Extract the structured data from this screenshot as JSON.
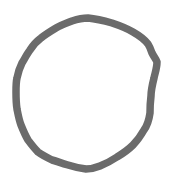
{
  "canvas": {
    "width": 175,
    "height": 187,
    "background_color": "#ffffff",
    "description": "hand-drawn closed circular outline"
  },
  "shape": {
    "name": "hand-drawn-circle",
    "kind": "closed-polyline",
    "stroke_color": "#6b6b6b",
    "stroke_width": 7.5,
    "fill": "none",
    "stroke_linecap": "round",
    "stroke_linejoin": "round",
    "bounds": {
      "left": 13,
      "top": 14,
      "right": 160,
      "bottom": 173
    },
    "vertices": [
      [
        88,
        18
      ],
      [
        112,
        23
      ],
      [
        133,
        32
      ],
      [
        148,
        44
      ],
      [
        152,
        53
      ],
      [
        157,
        62
      ],
      [
        154,
        78
      ],
      [
        151,
        96
      ],
      [
        150,
        113
      ],
      [
        144,
        130
      ],
      [
        133,
        145
      ],
      [
        117,
        157
      ],
      [
        100,
        166
      ],
      [
        86,
        169
      ],
      [
        68,
        165
      ],
      [
        52,
        160
      ],
      [
        38,
        152
      ],
      [
        28,
        140
      ],
      [
        21,
        125
      ],
      [
        17,
        109
      ],
      [
        16,
        92
      ],
      [
        17,
        78
      ],
      [
        22,
        63
      ],
      [
        30,
        50
      ],
      [
        41,
        38
      ],
      [
        56,
        28
      ],
      [
        72,
        21
      ]
    ],
    "path_d": "M 88 18 C 98 19 105 21 112 23 C 121 26 128 29 133 32 C 140 36 145 40 148 44 C 150 47 151 50 152 53 C 154 57 156 59 157 62 C 157 68 155 73 154 78 C 152 86 151 91 151 96 C 150 104 150 109 150 113 C 149 120 147 126 144 130 C 140 137 137 141 133 145 C 127 151 122 154 117 157 C 111 161 105 164 100 166 C 95 168 90 169 86 169 C 79 168 74 167 68 165 C 61 163 56 161 52 160 C 46 157 42 155 38 152 C 34 148 31 144 28 140 C 25 135 23 130 21 125 C 19 120 18 114 17 109 C 16 103 16 97 16 92 C 16 87 16 82 17 78 C 18 73 20 67 22 63 C 25 58 27 54 30 50 C 33 45 37 41 41 38 C 46 34 51 31 56 28 C 61 25 67 23 72 21 C 78 19 83 18 88 18 Z"
  }
}
